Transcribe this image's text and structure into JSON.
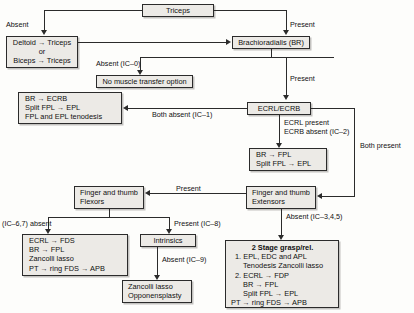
{
  "diagram": {
    "nodes": {
      "triceps": {
        "label": "Triceps"
      },
      "deltoid_biceps": {
        "line1": "Deltoid → Triceps",
        "line2": "or",
        "line3": "Biceps → Triceps"
      },
      "brachioradialis": {
        "label": "Brachioradialis (BR)"
      },
      "no_transfer": {
        "label": "No muscle transfer option"
      },
      "br_ecrb": {
        "line1": "BR → ECRB",
        "line2": "Split FPL → EPL",
        "line3": "FPL and EPL tenodesis"
      },
      "ecrl_ecrb": {
        "label": "ECRL/ECRB"
      },
      "br_fpl": {
        "line1": "BR → FPL",
        "line2": "Split FPL → EPL"
      },
      "finger_thumb_flexors": {
        "line1": "Finger and thumb",
        "line2": "Flexors"
      },
      "finger_thumb_extensors": {
        "line1": "Finger and thumb",
        "line2": "Extensors"
      },
      "ecrl_fds": {
        "line1": "ECRL → FDS",
        "line2": "BR → FPL",
        "line3": "Zancolli lasso",
        "line4": "PT → ring FDS → APB"
      },
      "intrinsics": {
        "label": "Intrinsics"
      },
      "zancolli_oppo": {
        "line1": "Zancolli lasso",
        "line2": "Opponensplasty"
      },
      "two_stage": {
        "title": "2 Stage grasp/rel.",
        "line1": "1. EPL, EDC and APL",
        "line2": "Tenodesis Zancolli lasso",
        "line3": "2. ECRL → FDP",
        "line4": "BR → FPL",
        "line5": "Split FPL → EPL",
        "line6": "PT → ring FDS → APB"
      }
    },
    "edge_labels": {
      "absent": "Absent",
      "present": "Present",
      "absent_ic0": "Absent (IC–0)",
      "present2": "Present",
      "both_absent_ic1": "Both absent (IC–1)",
      "ecrl_present": "ECRL present",
      "ecrb_absent_ic2": "ECRB absent (IC–2)",
      "both_present": "Both present",
      "present3": "Present",
      "absent_ic345": "Absent (IC–3,4,5)",
      "ic67_absent": "(IC–6,7) absent",
      "present_ic8": "Present (IC–8)",
      "absent_ic9": "Absent (IC–9)"
    },
    "colors": {
      "box_fill": "#eceae6",
      "line": "#2b2b2b",
      "text": "#111111",
      "background": "#fdfdfb"
    }
  }
}
